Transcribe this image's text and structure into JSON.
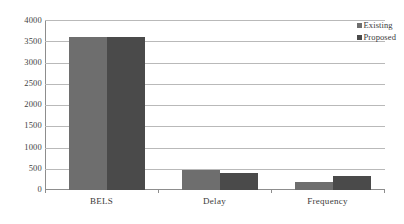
{
  "chart_data": {
    "type": "bar",
    "title": "",
    "subtitle": "",
    "xlabel": "",
    "ylabel": "",
    "categories": [
      "BELS",
      "Delay",
      "Frequency"
    ],
    "series": [
      {
        "name": "Existing",
        "values": [
          3630,
          480,
          195
        ],
        "color": "#6e6e6e"
      },
      {
        "name": "Proposed",
        "values": [
          3620,
          400,
          330
        ],
        "color": "#4a4a4a"
      }
    ],
    "ylim": [
      0,
      4000
    ],
    "ytick_labels": [
      "0",
      "500",
      "1000",
      "1500",
      "2000",
      "2500",
      "3000",
      "3500",
      "4000"
    ],
    "ytick_values": [
      0,
      500,
      1000,
      1500,
      2000,
      2500,
      3000,
      3500,
      4000
    ],
    "grid": true,
    "grid_axis": "y",
    "legend_position": "top-right",
    "bar_gap": 0,
    "orientation": "vertical"
  },
  "legend": {
    "entries": [
      {
        "label": "Existing",
        "marker": "square-marker",
        "color": "#6e6e6e"
      },
      {
        "label": "Proposed",
        "marker": "square-marker",
        "color": "#4a4a4a"
      }
    ]
  },
  "axes": {
    "y": {
      "ticks": [
        "4000",
        "3500",
        "3000",
        "2500",
        "2000",
        "1500",
        "1000",
        "500",
        "0"
      ]
    },
    "x": {
      "ticks": [
        "BELS",
        "Delay",
        "Frequency"
      ]
    }
  }
}
